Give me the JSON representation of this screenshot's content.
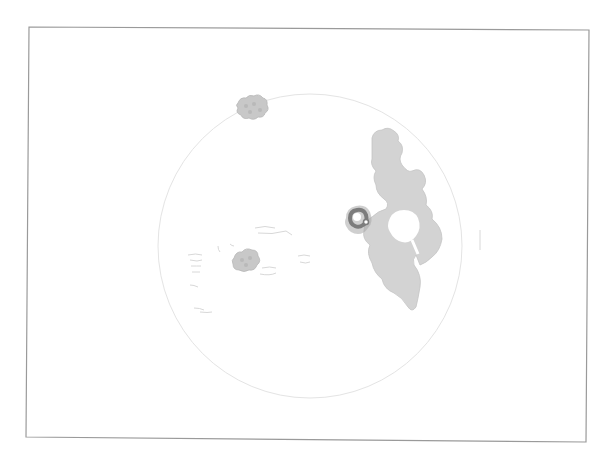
{
  "image": {
    "description": "Grayscale figure: thin rectangular frame containing a faint circular outline with scattered gray blob shapes and one large irregular blob with a dark ring marker",
    "colors": {
      "background": "#ffffff",
      "frame": "#9a9a9a",
      "circle_outline": "#e4e4e4",
      "large_blob": "#d3d3d3",
      "small_blobs": "#c8c8c8",
      "dark_ring": "#7c7c7c",
      "faint_marks": "#e0e0e0"
    },
    "frame": {
      "top_left": [
        29,
        27
      ],
      "top_right": [
        589,
        30
      ],
      "bottom_right": [
        586,
        442
      ],
      "bottom_left": [
        26,
        437
      ]
    },
    "circle": {
      "cx": 310,
      "cy": 246,
      "r": 152
    },
    "objects": [
      {
        "name": "small-blob-top",
        "cx": 250,
        "cy": 108
      },
      {
        "name": "large-blob-right",
        "cx": 392,
        "cy": 220
      },
      {
        "name": "dark-ring-marker",
        "cx": 358,
        "cy": 220
      },
      {
        "name": "small-blob-lower",
        "cx": 245,
        "cy": 260
      }
    ]
  }
}
